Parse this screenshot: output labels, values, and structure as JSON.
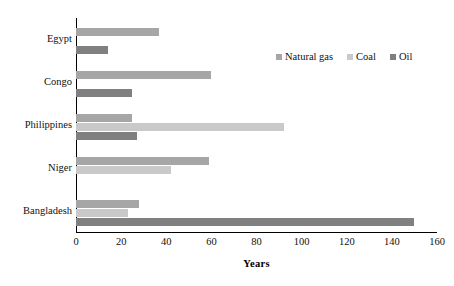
{
  "chart_data": {
    "type": "bar",
    "orientation": "horizontal",
    "title": "",
    "xlabel": "Years",
    "ylabel": "",
    "xlim": [
      0,
      160
    ],
    "xticks": [
      "0",
      "20",
      "40",
      "60",
      "80",
      "100",
      "120",
      "140",
      "160"
    ],
    "xtick_values": [
      0,
      20,
      40,
      60,
      80,
      100,
      120,
      140,
      160
    ],
    "grid": false,
    "legend_position": "top-right",
    "categories": [
      "Egypt",
      "Congo",
      "Philippines",
      "Niger",
      "Bangladesh"
    ],
    "series": [
      {
        "name": "Natural gas",
        "color": "#a6a6a6",
        "values": [
          37,
          60,
          25,
          59,
          28
        ]
      },
      {
        "name": "Coal",
        "color": "#c9c9c9",
        "values": [
          0,
          0,
          92,
          42,
          23
        ]
      },
      {
        "name": "Oil",
        "color": "#808080",
        "values": [
          14,
          25,
          27,
          0,
          150
        ]
      }
    ]
  },
  "axis": {
    "x_title": "Years",
    "axis_color": "#000000"
  },
  "legend": {
    "entries": [
      {
        "label": "Natural gas",
        "color": "#a6a6a6"
      },
      {
        "label": "Coal",
        "color": "#c9c9c9"
      },
      {
        "label": "Oil",
        "color": "#808080"
      }
    ]
  }
}
